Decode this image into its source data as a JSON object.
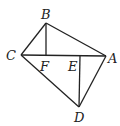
{
  "diagram": {
    "type": "geometry",
    "points": {
      "A": {
        "label": "A",
        "x": 106,
        "y": 56
      },
      "B": {
        "label": "B",
        "x": 46,
        "y": 23
      },
      "C": {
        "label": "C",
        "x": 21,
        "y": 55
      },
      "D": {
        "label": "D",
        "x": 79,
        "y": 107
      },
      "E": {
        "label": "E",
        "x": 80,
        "y": 55
      },
      "F": {
        "label": "F",
        "x": 46,
        "y": 55
      }
    },
    "segments": [
      [
        "B",
        "C"
      ],
      [
        "B",
        "A"
      ],
      [
        "C",
        "A"
      ],
      [
        "B",
        "F"
      ],
      [
        "C",
        "D"
      ],
      [
        "A",
        "D"
      ],
      [
        "E",
        "D"
      ]
    ]
  }
}
